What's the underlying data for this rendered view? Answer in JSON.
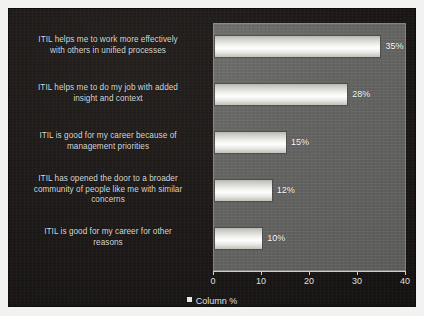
{
  "chart_data": {
    "type": "bar",
    "orientation": "horizontal",
    "title": "",
    "subtitle": "",
    "xlabel": "",
    "ylabel": "",
    "xlim": [
      0,
      40
    ],
    "xticks": [
      "0",
      "10",
      "20",
      "30",
      "40"
    ],
    "grid": false,
    "legend_position": "bottom-center",
    "legend": [
      "Column %"
    ],
    "categories": [
      "ITIL helps me to work more effectively with others in unified processes",
      "ITIL helps me to do my job with added insight and context",
      "ITIL is good for my career because of management priorities",
      "ITIL has opened the door to a broader community of people like me with similar concerns",
      "ITIL is good for my career for other reasons"
    ],
    "category_lines": [
      [
        "ITIL helps me to work more effectively",
        "with others in unified processes"
      ],
      [
        "ITIL helps me to do my job with added",
        "insight and context"
      ],
      [
        "ITIL is good for my career because of",
        "management priorities"
      ],
      [
        "ITIL has opened the door to a broader",
        "community of people like me with similar",
        "concerns"
      ],
      [
        "ITIL is good for my career for other",
        "reasons"
      ]
    ],
    "series": [
      {
        "name": "Column %",
        "values": [
          35,
          28,
          15,
          12,
          10
        ],
        "data_labels": [
          "35%",
          "28%",
          "15%",
          "12%",
          "10%"
        ]
      }
    ],
    "colors": {
      "figure_background": "#f2f2f0",
      "canvas_background": "#1b1817",
      "plot_background": "#636361",
      "bar_fill": "#f4f4f0",
      "text": "#dcdcd8",
      "axis_line": "#cfcfca"
    }
  }
}
